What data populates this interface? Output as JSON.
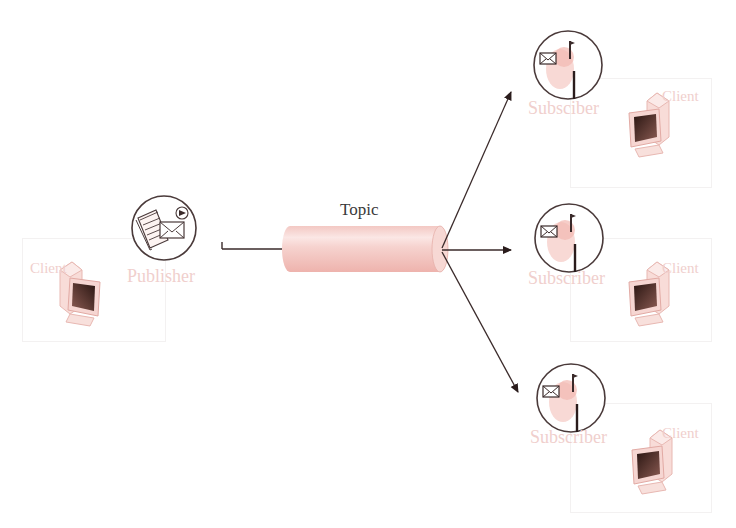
{
  "diagram": {
    "type": "publish-subscribe",
    "topic": {
      "label": "Topic"
    },
    "publisher": {
      "label": "Publisher",
      "icon": "publisher-document-envelope-icon"
    },
    "publisher_client": {
      "label": "Client",
      "icon": "computer-icon"
    },
    "subscribers": [
      {
        "label": "Subsciber",
        "icon": "mailbox-icon",
        "client_label": "Client"
      },
      {
        "label": "Subscriber",
        "icon": "mailbox-icon",
        "client_label": "Client"
      },
      {
        "label": "Subscriber",
        "icon": "mailbox-icon",
        "client_label": "Client"
      }
    ],
    "colors": {
      "line": "#3a2a2a",
      "cylinder": "#f2c4c0",
      "cylinder_highlight": "#fbe8e6",
      "faint_label": "#f0cfcd",
      "icon_stroke": "#4a3a3a"
    }
  }
}
